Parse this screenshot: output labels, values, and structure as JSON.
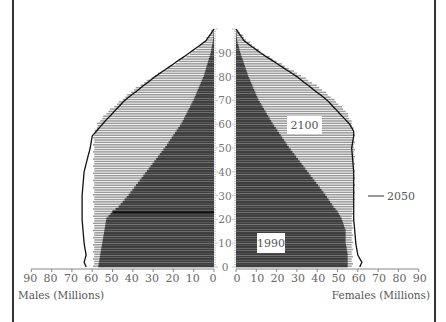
{
  "chart_data": {
    "type": "bar",
    "subtype": "population-pyramid",
    "title": "",
    "xlabel_left": "Males (Millions)",
    "xlabel_right": "Females (Millions)",
    "ylabel": "Age",
    "x_ticks": [
      0,
      10,
      20,
      30,
      40,
      50,
      60,
      70,
      80,
      90
    ],
    "x_range": [
      0,
      90
    ],
    "age_ticks": [
      0,
      10,
      20,
      30,
      40,
      50,
      60,
      70,
      80,
      90
    ],
    "age_range": [
      0,
      100
    ],
    "grid": false,
    "annotations": [
      "1990",
      "2050",
      "2100"
    ],
    "series": [
      {
        "name": "2100",
        "style": "light hatched bars",
        "color": "#9a9a9a",
        "ages": [
          0,
          5,
          10,
          20,
          30,
          40,
          50,
          55,
          60,
          65,
          70,
          75,
          80,
          85,
          90,
          95,
          100
        ],
        "males": [
          59,
          59,
          59,
          59,
          59,
          59,
          59,
          59,
          57,
          52,
          45,
          38,
          29,
          19,
          10,
          4,
          0
        ],
        "females": [
          57,
          57,
          57,
          57,
          58,
          58,
          58,
          58,
          57,
          54,
          48,
          41,
          32,
          22,
          12,
          5,
          0
        ]
      },
      {
        "name": "1990",
        "style": "dark bars",
        "color": "#3f3f3f",
        "ages": [
          0,
          5,
          10,
          15,
          20,
          23,
          25,
          30,
          40,
          50,
          60,
          70,
          80,
          90,
          95,
          100
        ],
        "males": [
          57,
          56,
          55,
          54,
          53,
          50,
          47,
          42,
          33,
          24,
          16,
          10,
          5,
          1.5,
          0.5,
          0
        ],
        "females": [
          55,
          55,
          54,
          54,
          52,
          50,
          48,
          44,
          35,
          26,
          18,
          11,
          6,
          2,
          0.5,
          0
        ]
      },
      {
        "name": "2050",
        "style": "outline line",
        "color": "#111111",
        "ages": [
          0,
          2,
          5,
          10,
          20,
          30,
          40,
          50,
          55,
          57,
          60,
          70,
          80,
          90,
          95,
          100
        ],
        "males": [
          63,
          64,
          63,
          64,
          65,
          65,
          64,
          61,
          60,
          58,
          55,
          44,
          29,
          12,
          4,
          0
        ],
        "females": [
          61,
          62,
          60,
          59,
          58,
          58,
          58,
          57,
          58,
          58,
          56,
          45,
          30,
          12,
          4,
          0
        ]
      }
    ]
  },
  "labels": {
    "year_1990": "1990",
    "year_2050": "2050",
    "year_2100": "2100",
    "males_axis": "Males (Millions)",
    "females_axis": "Females (Millions)"
  }
}
